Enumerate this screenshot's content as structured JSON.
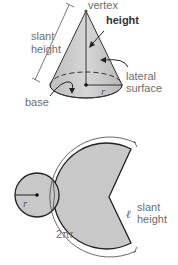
{
  "cone_diagram": {
    "labels": {
      "vertex": "vertex",
      "height": "height",
      "slant_height_line1": "slant",
      "slant_height_line2": "height",
      "lateral_surface_line1": "lateral",
      "lateral_surface_line2": "surface",
      "base": "base",
      "radius": "r"
    }
  },
  "net_diagram": {
    "labels": {
      "radius": "r",
      "circumference": "2πr",
      "slant_symbol": "ℓ",
      "slant_height_line1": "slant",
      "slant_height_line2": "height"
    }
  },
  "colors": {
    "fill": "#c8c8c8",
    "stroke": "#222222",
    "label": "#6e6e6e"
  }
}
